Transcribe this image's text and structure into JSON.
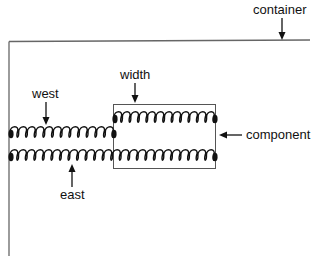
{
  "diagram": {
    "labels": {
      "container": "container",
      "width": "width",
      "west": "west",
      "east": "east",
      "component": "component"
    },
    "springs": [
      {
        "name": "west",
        "x1": 10,
        "x2": 114,
        "y": 132,
        "coils": 12
      },
      {
        "name": "width",
        "x1": 114,
        "x2": 215,
        "y": 117,
        "coils": 12
      },
      {
        "name": "east",
        "x1": 10,
        "x2": 215,
        "y": 155,
        "coils": 24
      }
    ],
    "colors": {
      "ink": "#111111",
      "frame": "#666666"
    }
  }
}
